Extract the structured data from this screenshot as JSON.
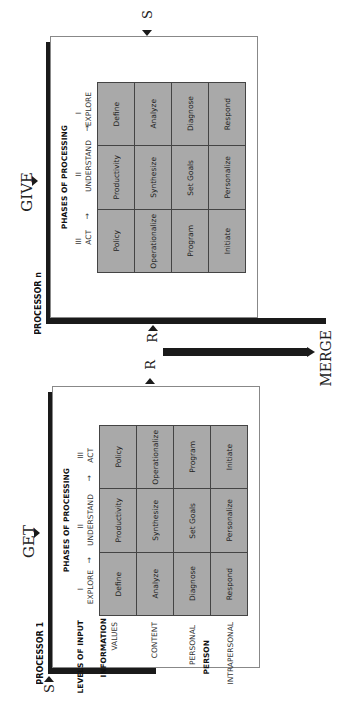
{
  "orientation": "rotated 90 degrees counter-clockwise",
  "processor_n": {
    "title": "PROCESSOR n",
    "input_label": "GIVE",
    "phases_title": "PHASES OF PROCESSING",
    "phases": [
      {
        "numeral": "III",
        "label": "ACT"
      },
      {
        "numeral": "II",
        "label": "UNDERSTAND"
      },
      {
        "numeral": "I",
        "label": "EXPLORE"
      }
    ],
    "grid": [
      [
        "Policy",
        "Productivity",
        "Define"
      ],
      [
        "Operationalize",
        "Synthesize",
        "Analyze"
      ],
      [
        "Program",
        "Set Goals",
        "Diagnose"
      ],
      [
        "Initiate",
        "Personalize",
        "Respond"
      ]
    ],
    "connector_top": "S",
    "connector_bottom": "R"
  },
  "processor_1": {
    "title": "PROCESSOR 1",
    "input_label": "GET",
    "phases_title": "PHASES OF PROCESSING",
    "phases": [
      {
        "numeral": "I",
        "label": "EXPLORE"
      },
      {
        "numeral": "II",
        "label": "UNDERSTAND"
      },
      {
        "numeral": "III",
        "label": "ACT"
      }
    ],
    "levels_title": "LEVELS OF INPUT",
    "levels": [
      {
        "group": "INFORMATION",
        "items": [
          "VALUES",
          "CONTENT"
        ]
      },
      {
        "group": "PERSON",
        "items": [
          "PERSONAL",
          "INTRAPERSONAL"
        ]
      }
    ],
    "grid": [
      [
        "Define",
        "Productivity",
        "Policy"
      ],
      [
        "Analyze",
        "Synthesize",
        "Operationalize"
      ],
      [
        "Diagnose",
        "Set Goals",
        "Program"
      ],
      [
        "Respond",
        "Personalize",
        "Initiate"
      ]
    ],
    "connector_top": "R",
    "connector_bottom": "S"
  },
  "merge_label": "MERGE"
}
